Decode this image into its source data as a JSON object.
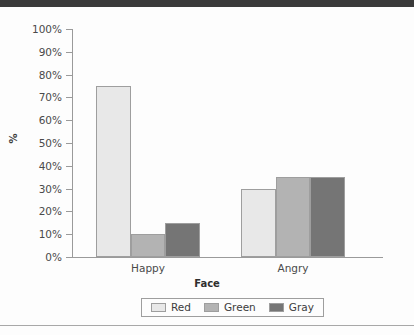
{
  "chart_data": {
    "type": "bar",
    "title": "",
    "subtitle": "",
    "xlabel": "Face",
    "ylabel": "%",
    "categories": [
      "Happy",
      "Angry"
    ],
    "series": [
      {
        "name": "Red",
        "values": [
          75,
          30
        ],
        "color": "#e8e8e8"
      },
      {
        "name": "Green",
        "values": [
          10,
          35
        ],
        "color": "#b3b3b3"
      },
      {
        "name": "Gray",
        "values": [
          15,
          35
        ],
        "color": "#757575"
      }
    ],
    "ylim": [
      0,
      100
    ],
    "ytick_labels": [
      "100%",
      "90%",
      "80%",
      "70%",
      "60%",
      "50%",
      "40%",
      "30%",
      "20%",
      "10%",
      "0%"
    ],
    "ytick_values": [
      100,
      90,
      80,
      70,
      60,
      50,
      40,
      30,
      20,
      10,
      0
    ],
    "grid": false,
    "legend_position": "bottom",
    "legend_entries": [
      "Red",
      "Green",
      "Gray"
    ],
    "bar_gap_within_group": 0,
    "axis_color": "#9a9a9a"
  },
  "decor": {
    "top_band_color": "#3a3a3a",
    "bottom_rule_color": "#a8a8a8",
    "background_color": "#fdfdfd"
  }
}
